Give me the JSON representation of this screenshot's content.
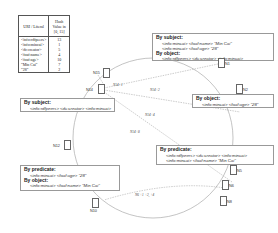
{
  "hash_table": {
    "headers": [
      "URI / Literal",
      "Hash Value in [0, 15]"
    ],
    "rows": [
      {
        "key": "<info:rdfpeers>",
        "value": "13"
      },
      {
        "key": "<info:mincai>",
        "value": "1"
      },
      {
        "key": "<dc:creator>",
        "value": "5"
      },
      {
        "key": "<foaf:name>",
        "value": "4"
      },
      {
        "key": "<foaf:age>",
        "value": "10"
      },
      {
        "key": "\"Min Cai\"",
        "value": "7"
      },
      {
        "key": "\"28\"",
        "value": "2"
      }
    ]
  },
  "boxes": {
    "n1": {
      "h1": "By subject:",
      "l1": "<info:mincai> <foaf:name> \"Min Cai\"",
      "l2": "<info:mincai> <foaf:age> \"28\"",
      "h2": "By object:",
      "l3": "<info:rdfpeers> <dc:creator> <info:mincai>"
    },
    "n2": {
      "h1": "By object:",
      "l1": "<info:mincai> <foaf:age> \"28\""
    },
    "n14": {
      "h1": "By subject:",
      "l1": "<info:rdfpeers> <dc:creator> <info:mincai>"
    },
    "n5": {
      "h1": "By predicate:",
      "l1": "<info:rdfpeers> <dc:creator> <info:mincai>",
      "l2": "<info:mincai> <foaf:name> \"Min Cai\""
    },
    "n10": {
      "h1": "By predicate:",
      "l1": "<info:mincai> <foaf:age> \"28\"",
      "h2": "By object:",
      "l2": "<info:mincai> <foaf:name> \"Min Cai\""
    }
  },
  "nodes": {
    "n1": "N1",
    "n2": "N2",
    "n5": "N5",
    "n6": "N6",
    "n8": "N8",
    "n10": "N10",
    "n12": "N12",
    "n14": "N14",
    "n15": "N15"
  },
  "edges": {
    "e1": "N14+1",
    "e2": "N14+2",
    "e3": "N14+4",
    "e4": "N14+8",
    "e5": "N6 +1 +2, +4"
  }
}
